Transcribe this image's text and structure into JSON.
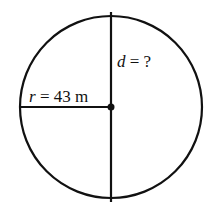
{
  "diagram": {
    "title": "",
    "circle": {
      "cx": 111,
      "cy": 107,
      "r": 91,
      "stroke": "#111111"
    },
    "radius_line": {
      "x1": 20,
      "y1": 107,
      "x2": 111,
      "y2": 107
    },
    "diameter_line": {
      "x1": 111,
      "y1": 12,
      "x2": 111,
      "y2": 202
    },
    "center_dot": {
      "cx": 111,
      "cy": 107,
      "r": 3.5
    },
    "labels": {
      "radius": {
        "var": "r",
        "rest": " = 43 m"
      },
      "diameter": {
        "var": "d",
        "rest": " = ?"
      }
    }
  }
}
